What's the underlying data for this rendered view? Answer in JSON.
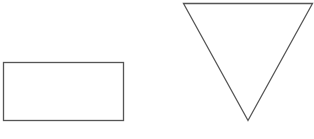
{
  "canvas": {
    "width": 314,
    "height": 139,
    "background": "#ffffff"
  },
  "shapes": [
    {
      "type": "rectangle",
      "x": 3.5,
      "y": 62.5,
      "width": 120,
      "height": 58,
      "stroke": "#555555",
      "fill": "#ffffff"
    },
    {
      "type": "triangle",
      "points": "183.5,3.5 312.5,3.5 248,120.5",
      "stroke": "#555555",
      "fill": "#ffffff"
    }
  ]
}
